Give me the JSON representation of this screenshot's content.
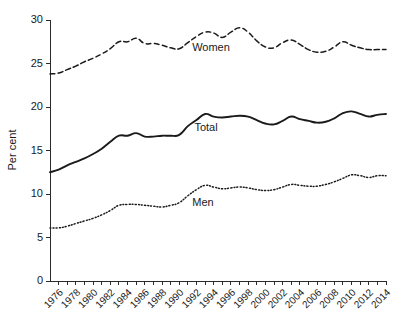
{
  "chart_data": {
    "type": "line",
    "title": "",
    "xlabel": "",
    "ylabel": "Per cent",
    "ylim": [
      0,
      30
    ],
    "yticks": [
      0,
      5,
      10,
      15,
      20,
      25,
      30
    ],
    "ytick_labels": [
      "0",
      "5",
      "10",
      "15",
      "20",
      "25",
      "30"
    ],
    "xlim": [
      1975,
      2014
    ],
    "grid": false,
    "legend_position": "inline-annotations",
    "x": [
      1975,
      1976,
      1977,
      1978,
      1979,
      1980,
      1981,
      1982,
      1983,
      1984,
      1985,
      1986,
      1987,
      1988,
      1989,
      1990,
      1991,
      1992,
      1993,
      1994,
      1995,
      1996,
      1997,
      1998,
      1999,
      2000,
      2001,
      2002,
      2003,
      2004,
      2005,
      2006,
      2007,
      2008,
      2009,
      2010,
      2011,
      2012,
      2013,
      2014
    ],
    "xtick_labels": [
      "1976",
      "1978",
      "1980",
      "1982",
      "1984",
      "1986",
      "1988",
      "1990",
      "1992",
      "1994",
      "1996",
      "1998",
      "2000",
      "2002",
      "2004",
      "2006",
      "2008",
      "2010",
      "2012",
      "2014"
    ],
    "xticks_labeled": [
      1976,
      1978,
      1980,
      1982,
      1984,
      1986,
      1988,
      1990,
      1992,
      1994,
      1996,
      1998,
      2000,
      2002,
      2004,
      2006,
      2008,
      2010,
      2012,
      2014
    ],
    "series": [
      {
        "name": "Women",
        "style": "dashed",
        "label": "Women",
        "values": [
          23.8,
          23.9,
          24.3,
          24.7,
          25.2,
          25.6,
          26.1,
          26.7,
          27.5,
          27.5,
          27.9,
          27.3,
          27.3,
          27.1,
          26.8,
          26.7,
          27.4,
          28.1,
          28.6,
          28.5,
          28.0,
          28.6,
          29.1,
          28.6,
          27.6,
          26.9,
          26.8,
          27.4,
          27.7,
          27.2,
          26.6,
          26.3,
          26.4,
          26.9,
          27.5,
          27.1,
          26.8,
          26.6,
          26.6,
          26.6
        ]
      },
      {
        "name": "Total",
        "style": "solid",
        "label": "Total",
        "values": [
          12.5,
          12.8,
          13.3,
          13.7,
          14.1,
          14.6,
          15.2,
          16.0,
          16.7,
          16.7,
          17.0,
          16.6,
          16.6,
          16.7,
          16.7,
          16.8,
          17.8,
          18.5,
          19.2,
          18.9,
          18.8,
          18.9,
          19.0,
          18.9,
          18.5,
          18.1,
          18.0,
          18.4,
          18.9,
          18.6,
          18.4,
          18.2,
          18.3,
          18.7,
          19.3,
          19.5,
          19.2,
          18.9,
          19.1,
          19.2
        ]
      },
      {
        "name": "Men",
        "style": "dotted",
        "label": "Men",
        "values": [
          6.1,
          6.1,
          6.3,
          6.6,
          6.9,
          7.2,
          7.6,
          8.1,
          8.7,
          8.8,
          8.8,
          8.7,
          8.6,
          8.5,
          8.7,
          9.0,
          9.8,
          10.5,
          11.0,
          10.8,
          10.6,
          10.7,
          10.8,
          10.7,
          10.5,
          10.4,
          10.5,
          10.8,
          11.1,
          11.0,
          10.9,
          10.9,
          11.1,
          11.4,
          11.8,
          12.2,
          12.1,
          11.9,
          12.1,
          12.1
        ]
      }
    ],
    "annotations": [
      {
        "text": "Women",
        "x_px": 211,
        "y_px": 51
      },
      {
        "text": "Total",
        "x_px": 206,
        "y_px": 131
      },
      {
        "text": "Men",
        "x_px": 203,
        "y_px": 206
      }
    ],
    "colors": {
      "axis": "#2b2b2b",
      "series": "#1a1a1a",
      "background": "#ffffff"
    }
  },
  "caption": {
    "fragment": ""
  }
}
